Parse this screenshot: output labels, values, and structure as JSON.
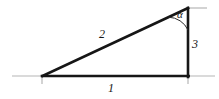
{
  "figure": {
    "name": "right-triangle-diagram",
    "background_color": "#ffffff",
    "stroke_color": "#161616",
    "axis_color": "#b0b0b0",
    "labels": {
      "hypotenuse": "2",
      "vertical_side": "3",
      "base_side": "1",
      "angle": "α"
    }
  },
  "geometry": {
    "left_vertex": {
      "x": 42,
      "y": 76
    },
    "right_vertex": {
      "x": 188,
      "y": 76
    },
    "apex_vertex": {
      "x": 188,
      "y": 8
    },
    "axis_line": {
      "x1": 12,
      "y1": 76,
      "x2": 215,
      "y2": 76
    },
    "axis_tick_left": {
      "x": 42,
      "y1": 76,
      "y2": 84
    },
    "axis_tick_right": {
      "x": 188,
      "y1": 76,
      "y2": 84
    },
    "apex_tick": {
      "x1": 188,
      "y1": 8,
      "x2": 206,
      "y2": 8
    },
    "angle_arc_radius": 22
  }
}
